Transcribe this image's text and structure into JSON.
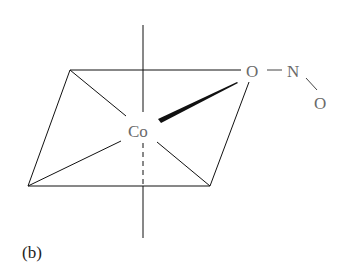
{
  "diagram": {
    "panel_label": "(b)",
    "central_atom": "Co",
    "ligand_atoms": {
      "bonded_oxygen": "O",
      "nitrogen": "N",
      "terminal_oxygen": "O"
    },
    "colors": {
      "lines": "#111111",
      "atom_text": "#6a6a6a",
      "label_text": "#222222"
    }
  }
}
